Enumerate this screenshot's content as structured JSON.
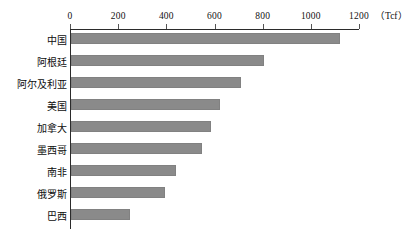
{
  "chart_data": {
    "type": "bar",
    "orientation": "horizontal",
    "title": "",
    "xlabel": "(Tcf)",
    "ylabel": "",
    "unit": "Tcf",
    "xlim": [
      0,
      1200
    ],
    "x_ticks": [
      0,
      200,
      400,
      600,
      800,
      1000,
      1200
    ],
    "x_tick_labels": [
      "0",
      "200",
      "400",
      "600",
      "800",
      "1000",
      "1200"
    ],
    "grid": false,
    "legend": null,
    "bar_color": "#8a8a8a",
    "axis_color": "#2b2b2b",
    "categories": [
      "中国",
      "阿根廷",
      "阿尔及利亚",
      "美国",
      "加拿大",
      "墨西哥",
      "南非",
      "俄罗斯",
      "巴西"
    ],
    "values": [
      1115,
      802,
      707,
      620,
      580,
      545,
      435,
      390,
      245
    ],
    "series": [
      {
        "name": "",
        "values": [
          1115,
          802,
          707,
          620,
          580,
          545,
          435,
          390,
          245
        ]
      }
    ]
  },
  "axis": {
    "unit_label": "（Tcf）"
  },
  "caption": {
    "text": ""
  }
}
